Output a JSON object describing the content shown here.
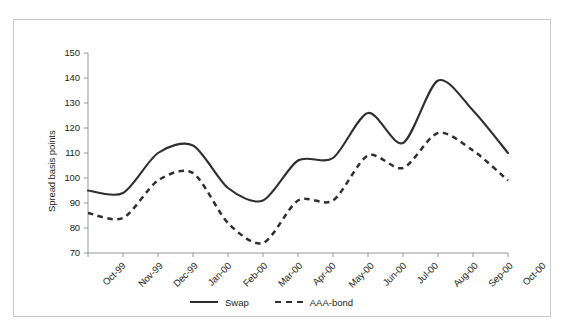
{
  "chart_data": {
    "type": "line",
    "title": "",
    "xlabel": "",
    "ylabel": "Spread basis points",
    "categories": [
      "Oct-99",
      "Nov-99",
      "Dec-99",
      "Jan-00",
      "Feb-00",
      "Mar-00",
      "Apr-00",
      "May-00",
      "Jun-00",
      "Jul-00",
      "Aug-00",
      "Sep-00",
      "Oct-00"
    ],
    "ylim": [
      70,
      150
    ],
    "yticks": [
      70,
      80,
      90,
      100,
      110,
      120,
      130,
      140,
      150
    ],
    "grid": false,
    "legend_position": "bottom-center",
    "series": [
      {
        "name": "Swap",
        "style": "solid",
        "color": "#2f2f2f",
        "values": [
          95,
          94,
          110,
          113,
          96,
          91,
          107,
          108,
          126,
          114,
          139,
          127,
          110
        ]
      },
      {
        "name": "AAA-bond",
        "style": "dashed",
        "color": "#2f2f2f",
        "values": [
          86,
          84,
          99,
          102,
          82,
          74,
          91,
          91,
          109,
          104,
          118,
          111,
          99
        ]
      }
    ],
    "annotations": []
  },
  "axes": {
    "y_tick_labels": [
      "150",
      "140",
      "130",
      "120",
      "110",
      "100",
      "90",
      "80",
      "70"
    ],
    "y_axis_title": "Spread basis points",
    "x_tick_labels": [
      "Oct-99",
      "Nov-99",
      "Dec-99",
      "Jan-00",
      "Feb-00",
      "Mar-00",
      "Apr-00",
      "May-00",
      "Jun-00",
      "Jul-00",
      "Aug-00",
      "Sep-00",
      "Oct-00"
    ]
  },
  "legend": {
    "items": [
      {
        "label": "Swap",
        "style": "solid"
      },
      {
        "label": "AAA-bond",
        "style": "dashed"
      }
    ]
  },
  "colors": {
    "line": "#2f2f2f",
    "axis": "#8c8c8c",
    "frame": "#c9c9c9",
    "text": "#231f20",
    "background": "#ffffff"
  }
}
